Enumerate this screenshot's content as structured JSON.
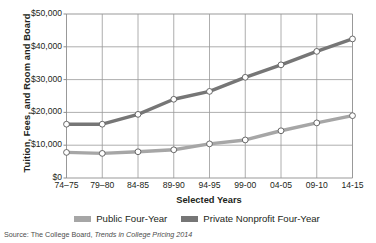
{
  "chart_data": {
    "type": "line",
    "title": "",
    "xlabel": "Selected Years",
    "ylabel": "Tuition, Fees, and Room and Board",
    "categories": [
      "74–75",
      "79–80",
      "84-85",
      "89-90",
      "94-95",
      "99-00",
      "04-05",
      "09-10",
      "14-15"
    ],
    "ylim": [
      0,
      50000
    ],
    "yticks": [
      0,
      10000,
      20000,
      30000,
      40000,
      50000
    ],
    "ytick_labels": [
      "$0",
      "$10,000",
      "$20,000",
      "$30,000",
      "$40,000",
      "$50,000"
    ],
    "grid": true,
    "legend_position": "bottom",
    "series": [
      {
        "name": "Public Four-Year",
        "color": "#a6a6a6",
        "values": [
          7800,
          7500,
          8000,
          8600,
          10400,
          11600,
          14400,
          16800,
          19000
        ]
      },
      {
        "name": "Private Nonprofit Four-Year",
        "color": "#767676",
        "values": [
          16400,
          16400,
          19400,
          24000,
          26400,
          30700,
          34500,
          38600,
          42400
        ]
      }
    ]
  },
  "source": {
    "prefix": "Source: The College Board, ",
    "italic": "Trends in College Pricing 2014"
  },
  "colors": {
    "axis": "#808080",
    "grid": "#999999",
    "text": "#231f20",
    "public": "#a6a6a6",
    "private": "#767676",
    "marker_fill": "#ffffff"
  }
}
